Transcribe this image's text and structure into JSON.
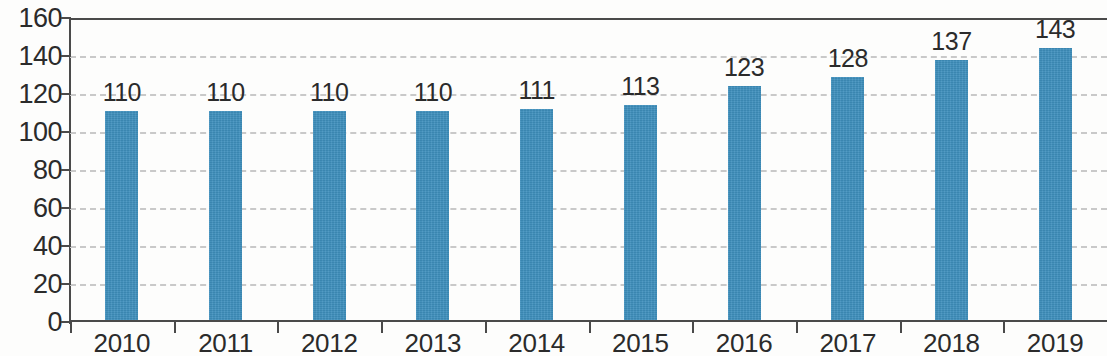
{
  "chart_data": {
    "type": "bar",
    "title": "",
    "subtitle": "",
    "xlabel": "",
    "ylabel": "",
    "categories": [
      "2010",
      "2011",
      "2012",
      "2013",
      "2014",
      "2015",
      "2016",
      "2017",
      "2018",
      "2019"
    ],
    "values": [
      110,
      110,
      110,
      110,
      111,
      113,
      123,
      128,
      137,
      143
    ],
    "data_labels": [
      "110",
      "110",
      "110",
      "110",
      "111",
      "113",
      "123",
      "128",
      "137",
      "143"
    ],
    "ylim": [
      0,
      160
    ],
    "y_ticks": [
      0,
      20,
      40,
      60,
      80,
      100,
      120,
      140,
      160
    ],
    "y_tick_labels": [
      "0",
      "20",
      "40",
      "60",
      "80",
      "100",
      "120",
      "140",
      "160"
    ],
    "grid": true,
    "grid_style": "dashed-horizontal",
    "legend": null,
    "legend_position": "none",
    "series": [
      {
        "name": "",
        "values": [
          110,
          110,
          110,
          110,
          111,
          113,
          123,
          128,
          137,
          143
        ],
        "color": "#3e8fbd"
      }
    ],
    "colors": {
      "bar": "#3e8fbd",
      "gridline": "#c9c9c9",
      "axis": "#4a4a4a",
      "text": "#2b2b2b",
      "background": "#fdfdfc"
    }
  }
}
